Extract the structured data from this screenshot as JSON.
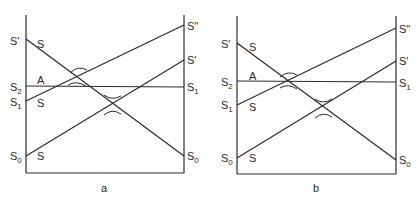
{
  "panels": [
    {
      "id": "a",
      "caption": "a",
      "left_labels": [
        {
          "base": "S",
          "sup": "'",
          "sub": "",
          "level": "top"
        },
        {
          "base": "S",
          "sup": "",
          "sub": "2",
          "level": "s2"
        },
        {
          "base": "S",
          "sup": "",
          "sub": "1",
          "level": "s1"
        },
        {
          "base": "S",
          "sup": "",
          "sub": "0",
          "level": "s0"
        }
      ],
      "right_labels": [
        {
          "base": "S",
          "sup": "\"",
          "sub": "",
          "level": "top"
        },
        {
          "base": "S",
          "sup": "'",
          "sub": "",
          "level": "mid"
        },
        {
          "base": "S",
          "sup": "",
          "sub": "1",
          "level": "s1"
        },
        {
          "base": "S",
          "sup": "",
          "sub": "0",
          "level": "s0"
        }
      ],
      "line_labels": [
        "S",
        "A",
        "S",
        "S"
      ],
      "lines": [
        {
          "name": "S-prime-to-S0",
          "from": "S'",
          "to": "S0"
        },
        {
          "name": "S1-to-S-double-prime",
          "from": "S1",
          "to": "S\""
        },
        {
          "name": "S0-to-S-prime",
          "from": "S0",
          "to": "S'"
        },
        {
          "name": "S2-to-S1-horizontal",
          "from": "S2",
          "to": "S1"
        }
      ]
    },
    {
      "id": "b",
      "caption": "b",
      "left_labels": [
        {
          "base": "S",
          "sup": "'",
          "sub": "",
          "level": "top"
        },
        {
          "base": "S",
          "sup": "",
          "sub": "2",
          "level": "s2"
        },
        {
          "base": "S",
          "sup": "",
          "sub": "1",
          "level": "s1"
        },
        {
          "base": "S",
          "sup": "",
          "sub": "0",
          "level": "s0"
        }
      ],
      "right_labels": [
        {
          "base": "S",
          "sup": "\"",
          "sub": "",
          "level": "top"
        },
        {
          "base": "S",
          "sup": "'",
          "sub": "",
          "level": "mid"
        },
        {
          "base": "S",
          "sup": "",
          "sub": "1",
          "level": "s1"
        },
        {
          "base": "S",
          "sup": "",
          "sub": "0",
          "level": "s0"
        }
      ],
      "line_labels": [
        "S",
        "A",
        "S",
        "S"
      ],
      "lines": [
        {
          "name": "S-prime-to-S0",
          "from": "S'",
          "to": "S0"
        },
        {
          "name": "S1-to-S-double-prime",
          "from": "S1",
          "to": "S\""
        },
        {
          "name": "S0-to-S-prime",
          "from": "S0",
          "to": "S'"
        },
        {
          "name": "S2-to-S1-horizontal",
          "from": "S2",
          "to": "S1"
        }
      ]
    }
  ]
}
